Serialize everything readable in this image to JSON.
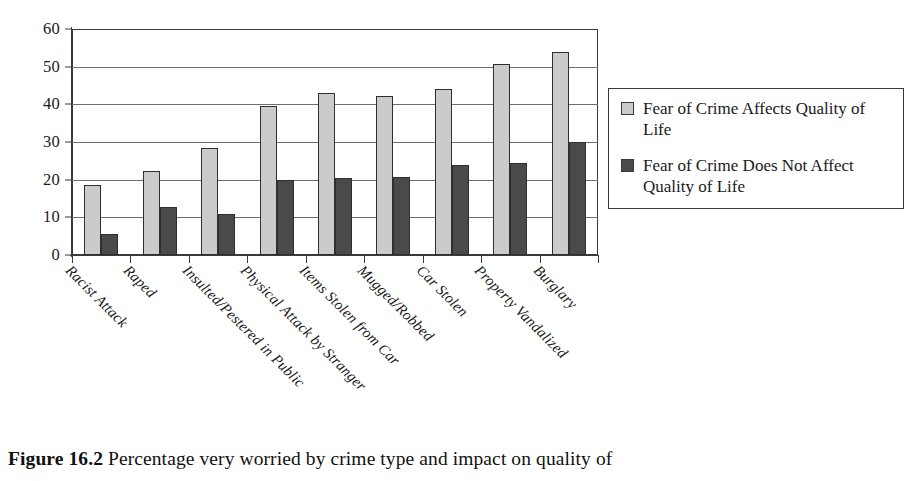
{
  "chart_data": {
    "type": "bar",
    "title": "",
    "xlabel": "",
    "ylabel": "",
    "ylim": [
      0,
      60
    ],
    "yticks": [
      0,
      10,
      20,
      30,
      40,
      50,
      60
    ],
    "grid": true,
    "legend_position": "right",
    "categories": [
      "Racist Attack",
      "Raped",
      "Insulted/Pestered in Public",
      "Physical Attack by Stranger",
      "Items Stolen from Car",
      "Mugged/Robbed",
      "Car Stolen",
      "Property Vandalized",
      "Burglary"
    ],
    "series": [
      {
        "name": "Fear of Crime Affects Quality of Life",
        "color": "#cbcbcb",
        "values": [
          18.6,
          22.3,
          28.5,
          39.6,
          43.0,
          42.1,
          44.1,
          50.6,
          53.8
        ]
      },
      {
        "name": "Fear of Crime Does Not Affect Quality of Life",
        "color": "#4a4a4a",
        "values": [
          5.6,
          12.7,
          10.8,
          19.8,
          20.4,
          20.8,
          24.0,
          24.4,
          30.1
        ]
      }
    ]
  },
  "legend": {
    "entries": [
      {
        "label": "Fear of Crime Affects Quality of Life",
        "swatch": "series-a"
      },
      {
        "label": "Fear of Crime Does Not Affect Quality of Life",
        "swatch": "series-b"
      }
    ]
  },
  "caption": {
    "label": "Figure 16.2",
    "text": "Percentage very worried by crime type and impact on quality of"
  }
}
